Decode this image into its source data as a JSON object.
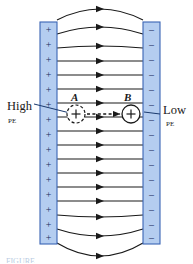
{
  "figure": {
    "type": "physics-diagram",
    "labels": {
      "high": "High",
      "high_pe": "PE",
      "low": "Low",
      "low_pe": "PE",
      "charge_a": "A",
      "charge_b": "B",
      "charge_sign": "+",
      "plate_left_sign": "+",
      "plate_right_sign": "–"
    },
    "caption": "FIGURE",
    "colors": {
      "plate_fill": "#b4cdf0",
      "plate_stroke": "#3a64b4",
      "field_line": "#1a1a1a",
      "text": "#1a1a1a",
      "leader": "#1a3a6e",
      "background": "#ffffff",
      "caption": "#7e9fc9"
    },
    "geometry": {
      "canvas_width": 193,
      "canvas_height": 264,
      "left_plate": {
        "x": 40,
        "y": 22,
        "width": 17,
        "height": 222
      },
      "right_plate": {
        "x": 143,
        "y": 22,
        "width": 17,
        "height": 222
      },
      "field_line_count": 16,
      "field_line_x_start": 57,
      "field_line_x_end": 143,
      "plate_left_charge_count": 14,
      "plate_right_charge_count": 14
    }
  },
  "field_lines": [
    {
      "y": 20,
      "bow": -11
    },
    {
      "y": 34,
      "bow": -7
    },
    {
      "y": 48,
      "bow": -2
    },
    {
      "y": 61,
      "bow": 0
    },
    {
      "y": 75,
      "bow": 0
    },
    {
      "y": 89,
      "bow": 0
    },
    {
      "y": 103,
      "bow": 0
    },
    {
      "y": 117,
      "bow": 0
    },
    {
      "y": 131,
      "bow": 0
    },
    {
      "y": 145,
      "bow": 0
    },
    {
      "y": 159,
      "bow": 0
    },
    {
      "y": 173,
      "bow": 0
    },
    {
      "y": 187,
      "bow": 0
    },
    {
      "y": 201,
      "bow": 0
    },
    {
      "y": 215,
      "bow": 2
    },
    {
      "y": 229,
      "bow": 7
    },
    {
      "y": 243,
      "bow": 13
    }
  ],
  "plate_charges": {
    "left_y": [
      30,
      45,
      60,
      75,
      90,
      105,
      120,
      135,
      150,
      165,
      180,
      195,
      210,
      225,
      238
    ],
    "right_y": [
      30,
      45,
      60,
      75,
      90,
      105,
      120,
      135,
      150,
      165,
      180,
      195,
      210,
      225,
      238
    ]
  },
  "charges": {
    "a": {
      "cx": 76,
      "cy": 114,
      "r": 9,
      "style": "dashed"
    },
    "b": {
      "cx": 131,
      "cy": 114,
      "r": 9,
      "style": "solid"
    },
    "motion_arrow": {
      "x1": 87,
      "y1": 114,
      "x2": 120,
      "y2": 114,
      "style": "dashed"
    }
  },
  "leaders": {
    "high": {
      "x1": 34,
      "y1": 104,
      "x2": 74,
      "y2": 114
    },
    "low": {
      "x1": 160,
      "y1": 114,
      "x2": 144,
      "y2": 112
    }
  }
}
